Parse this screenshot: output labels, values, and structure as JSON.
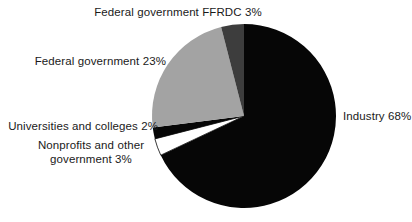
{
  "chart_data": {
    "type": "pie",
    "title": "",
    "subtitle": "",
    "xlabel": "",
    "ylabel": "",
    "legend_position": "none",
    "grid": false,
    "labels_outside": true,
    "start_angle_deg": 0,
    "direction": "clockwise",
    "categories": [
      "Industry",
      "Nonprofits and other government",
      "Universities and colleges",
      "Federal government",
      "Federal government FFRDC"
    ],
    "values": [
      68,
      3,
      2,
      23,
      3
    ],
    "unit": "%",
    "slices": [
      {
        "name": "Industry",
        "value": 68,
        "value_label": "68%",
        "label_text": "Industry 68%",
        "color": "#060606",
        "start_deg": 0,
        "end_deg": 244.8
      },
      {
        "name": "Nonprofits and other government",
        "value": 3,
        "value_label": "3%",
        "label_line_1": "Nonprofits and other",
        "label_line_2": "government 3%",
        "color": "#ffffff",
        "stroke": "#060606",
        "start_deg": 244.8,
        "end_deg": 255.6
      },
      {
        "name": "Universities and colleges",
        "value": 2,
        "value_label": "2%",
        "label_text": "Universities and colleges 2%",
        "color": "#060606",
        "start_deg": 255.6,
        "end_deg": 262.8
      },
      {
        "name": "Federal government",
        "value": 23,
        "value_label": "23%",
        "label_text": "Federal government 23%",
        "color": "#a3a3a3",
        "start_deg": 262.8,
        "end_deg": 345.6
      },
      {
        "name": "Federal government FFRDC",
        "value": 3,
        "value_label": "3%",
        "label_text": "Federal government FFRDC 3%",
        "color": "#3d3d3d",
        "start_deg": 345.6,
        "end_deg": 360
      }
    ],
    "geometry": {
      "center_x": 244,
      "center_y": 116,
      "radius": 92
    },
    "colors": {
      "background": "#ffffff",
      "text": "#1a1a1a",
      "industry": "#060606",
      "federal_government": "#a3a3a3",
      "ffrdc": "#3d3d3d",
      "nonprofits": "#ffffff",
      "universities": "#060606"
    }
  }
}
